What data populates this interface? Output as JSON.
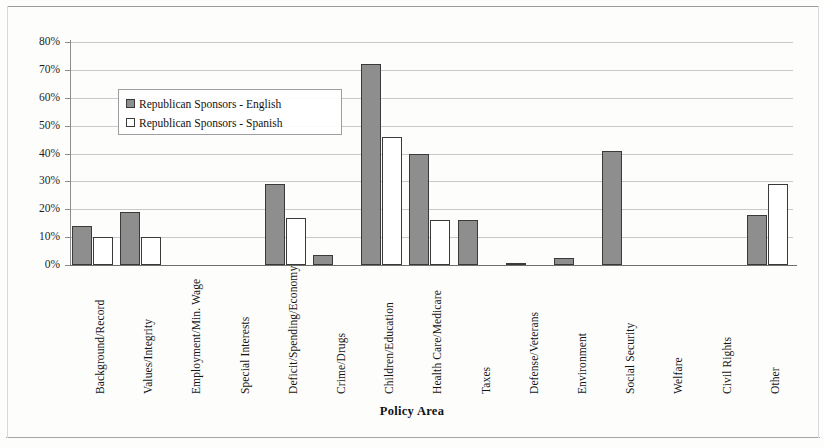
{
  "chart_data": {
    "type": "bar",
    "title": "",
    "xlabel": "Policy Area",
    "ylabel": "Volume of Ads",
    "ylim": [
      0,
      80
    ],
    "ytick_labels": [
      "0%",
      "10%",
      "20%",
      "30%",
      "40%",
      "50%",
      "60%",
      "70%",
      "80%"
    ],
    "ytick_values": [
      0,
      10,
      20,
      30,
      40,
      50,
      60,
      70,
      80
    ],
    "grid": true,
    "legend_position": "upper-left-inside",
    "categories": [
      "Background/Record",
      "Values/Integrity",
      "Employment/Min. Wage",
      "Special Interests",
      "Deficit/Spending/Economy",
      "Crime/Drugs",
      "Children/Education",
      "Health Care/Medicare",
      "Taxes",
      "Defense/Veterans",
      "Environment",
      "Social Security",
      "Welfare",
      "Civil Rights",
      "Other"
    ],
    "series": [
      {
        "name": "Republican Sponsors - English",
        "color": "#8e8e8e",
        "values": [
          14,
          19,
          0,
          0,
          29,
          3.5,
          72,
          40,
          16,
          0.5,
          2.5,
          41,
          0,
          0,
          18
        ]
      },
      {
        "name": "Republican Sponsors - Spanish",
        "color": "#ffffff",
        "values": [
          10,
          10,
          0,
          0,
          17,
          0,
          46,
          16,
          0,
          0,
          0,
          0,
          0,
          0,
          29
        ]
      }
    ]
  },
  "legend": {
    "items": [
      {
        "label": "Republican Sponsors - English",
        "swatch": "filled-gray"
      },
      {
        "label": "Republican Sponsors - Spanish",
        "swatch": "hollow-white"
      }
    ]
  }
}
